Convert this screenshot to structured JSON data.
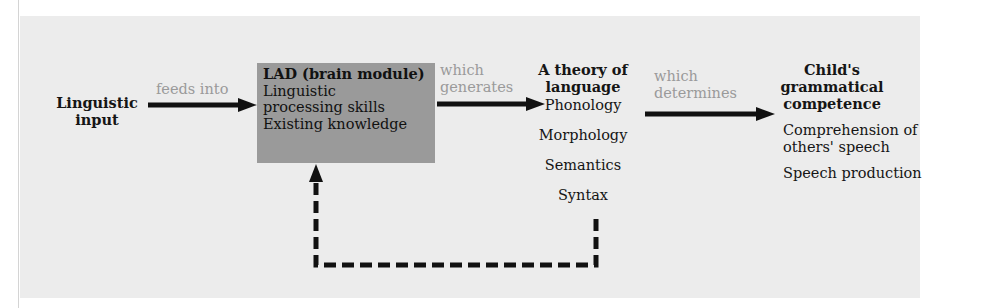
{
  "diagram": {
    "nodes": {
      "input": {
        "line1": "Linguistic",
        "line2": "input"
      },
      "lad": {
        "title": "LAD (brain module)",
        "items": [
          "Linguistic",
          "processing skills",
          "Existing knowledge"
        ]
      },
      "theory": {
        "title1": "A theory of",
        "title2": "language",
        "items": [
          "Phonology",
          "Morphology",
          "Semantics",
          "Syntax"
        ]
      },
      "competence": {
        "title1": "Child's",
        "title2": "grammatical",
        "title3": "competence",
        "items": [
          "Comprehension of",
          "others' speech",
          "Speech production"
        ]
      }
    },
    "edges": {
      "input_to_lad": {
        "label": "feeds into"
      },
      "lad_to_theory": {
        "label1": "which",
        "label2": "generates"
      },
      "theory_to_competence": {
        "label1": "which",
        "label2": "determines"
      },
      "feedback": {
        "style": "dashed",
        "from": "theory",
        "to": "lad"
      }
    },
    "colors": {
      "panel": "#ececec",
      "lad_box": "#9a9a9a",
      "edge_label": "#9a9a9a",
      "arrow": "#111111"
    }
  }
}
